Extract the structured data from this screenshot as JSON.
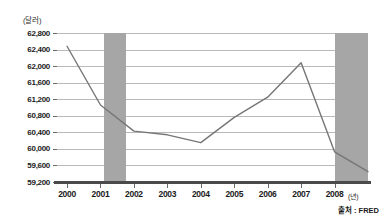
{
  "chart_data": {
    "type": "line",
    "title": "",
    "xlabel": "(년)",
    "ylabel": "(달러)",
    "x": [
      2000,
      2001,
      2002,
      2003,
      2004,
      2005,
      2006,
      2007,
      2008,
      2009
    ],
    "values": [
      62480,
      61060,
      60430,
      60340,
      60150,
      60760,
      61250,
      62080,
      59930,
      59450
    ],
    "series": [
      {
        "name": "실질 중위가구소득",
        "values": [
          62480,
          61060,
          60430,
          60340,
          60150,
          60760,
          61250,
          62080,
          59930,
          59450
        ]
      }
    ],
    "xlim": [
      1999.7,
      2009.0
    ],
    "ylim": [
      59200,
      62800
    ],
    "ytick_values": [
      62800,
      62400,
      62000,
      61600,
      61200,
      60800,
      60400,
      60000,
      59600,
      59200
    ],
    "ytick_labels": [
      "62,800",
      "62,400",
      "62,000",
      "61,600",
      "61,200",
      "60,800",
      "60,400",
      "60,000",
      "59,600",
      "59,200"
    ],
    "xtick_values": [
      2000,
      2001,
      2002,
      2003,
      2004,
      2005,
      2006,
      2007,
      2008
    ],
    "xtick_labels": [
      "2000",
      "2001",
      "2002",
      "2003",
      "2004",
      "2005",
      "2006",
      "2007",
      "2008"
    ],
    "grid": "horizontal",
    "legend": "none",
    "shaded_bands": [
      {
        "name": "recession-2001",
        "x_start": 2001.1,
        "x_end": 2001.75
      },
      {
        "name": "recession-2008",
        "x_start": 2008.0,
        "x_end": 2009.0
      }
    ],
    "colors": {
      "line": "#767676",
      "band": "#a6a6a6",
      "grid": "#b9b9b9",
      "axis": "#4a4a4a",
      "text": "#1b1b1b"
    }
  },
  "axes": {
    "y_unit_label": "(달러)",
    "x_unit_label": "(년)"
  },
  "footer": {
    "source": "출처 : FRED"
  }
}
